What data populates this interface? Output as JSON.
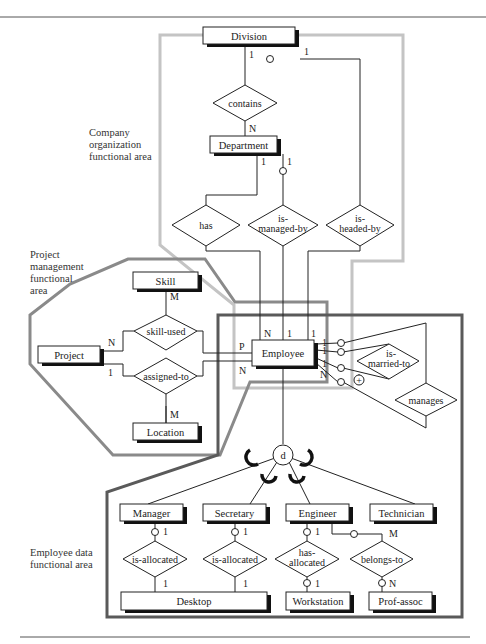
{
  "areas": {
    "company": [
      "Company",
      "organization",
      "functional area"
    ],
    "project": [
      "Project",
      "management",
      "functional",
      "area"
    ],
    "employee": [
      "Employee data",
      "functional area"
    ]
  },
  "region_colors": {
    "company": "#c4c4c4",
    "project": "#8a8a8a",
    "employee": "#5a5a5a"
  },
  "entities": {
    "division": "Division",
    "department": "Department",
    "skill": "Skill",
    "project": "Project",
    "location": "Location",
    "employee": "Employee",
    "manager": "Manager",
    "secretary": "Secretary",
    "engineer": "Engineer",
    "technician": "Technician",
    "desktop": "Desktop",
    "workstation": "Workstation",
    "prof_assoc": "Prof-assoc"
  },
  "relationships": {
    "contains": [
      "contains"
    ],
    "has": [
      "has"
    ],
    "is_managed_by": [
      "is-",
      "managed-by"
    ],
    "is_headed_by": [
      "is-",
      "headed-by"
    ],
    "skill_used": [
      "skill-used"
    ],
    "assigned_to": [
      "assigned-to"
    ],
    "is_married_to": [
      "is-",
      "married-to"
    ],
    "manages": [
      "manages"
    ],
    "mgr_is_allocated": [
      "is-allocated"
    ],
    "sec_is_allocated": [
      "is-allocated"
    ],
    "has_allocated": [
      "has-",
      "allocated"
    ],
    "belongs_to": [
      "belongs-to"
    ]
  },
  "specialization": {
    "symbol": "d",
    "type": "disjoint"
  },
  "cardinalities": {
    "division_headed": "1",
    "division_contains": "1",
    "department_contains": "N",
    "department_has": "1",
    "department_managed": "1",
    "skill_used_skill": "M",
    "project_skill_used": "N",
    "project_assigned": "1",
    "location_assigned": "M",
    "employee_P": "P",
    "employee_N_left": "N",
    "employee_N_top": "N",
    "employee_1_mid": "1",
    "employee_1_right": "1",
    "emp_married_1a": "1",
    "emp_married_1b": "1",
    "emp_manages_1": "1",
    "emp_manages_N": "N",
    "manager_1": "1",
    "mgr_desktop_1": "1",
    "secretary_1": "1",
    "sec_desktop_1": "1",
    "engineer_1": "1",
    "workstation_1": "1",
    "engineer_M": "M",
    "prof_assoc_N": "N"
  },
  "symbols": {
    "plus": "+"
  }
}
